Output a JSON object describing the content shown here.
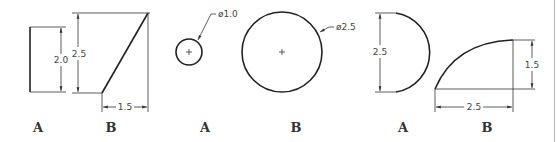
{
  "figure": {
    "groups": [
      {
        "id": "line-group",
        "items": [
          {
            "label": "A",
            "dimensions": {
              "height": "2.0"
            },
            "shape": "vertical-line"
          },
          {
            "label": "B",
            "dimensions": {
              "height": "2.5",
              "width": "1.5"
            },
            "shape": "inclined-line"
          }
        ]
      },
      {
        "id": "circle-group",
        "items": [
          {
            "label": "A",
            "dimensions": {
              "diameter": "ø1.0"
            },
            "shape": "circle"
          },
          {
            "label": "B",
            "dimensions": {
              "diameter": "ø2.5"
            },
            "shape": "circle"
          }
        ]
      },
      {
        "id": "arc-group",
        "items": [
          {
            "label": "A",
            "dimensions": {
              "height": "2.5"
            },
            "shape": "semicircle-arc"
          },
          {
            "label": "B",
            "dimensions": {
              "height": "1.5",
              "width": "2.5"
            },
            "shape": "quarter-arc"
          }
        ]
      }
    ]
  },
  "colors": {
    "line": "#222222",
    "dim": "#333333",
    "text": "#444444",
    "rule": "#bbbbbb"
  }
}
